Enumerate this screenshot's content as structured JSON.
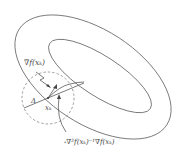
{
  "diagram": {
    "labels": {
      "gradient": "∇f(x_k)",
      "gradient_display": "∇f(xₖ)",
      "point": "x_k",
      "point_display": "xₖ",
      "radius": "Δ",
      "newton_step": "-∇²f(x_k)⁻¹∇f(x_k)",
      "newton_step_display": "-∇²f(xₖ)⁻¹∇f(xₖ)"
    },
    "colors": {
      "stroke": "#555555",
      "dashed": "#777777",
      "background": "#ffffff"
    }
  }
}
